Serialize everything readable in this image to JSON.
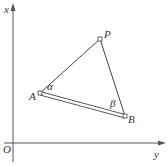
{
  "figure": {
    "type": "geometry-diagram",
    "axes": {
      "vertical_label": "x",
      "horizontal_label": "y",
      "origin_label": "O"
    },
    "points": {
      "P": {
        "label": "P"
      },
      "A": {
        "label": "A"
      },
      "B": {
        "label": "B"
      }
    },
    "angles": {
      "alpha": "α",
      "beta": "β"
    },
    "colors": {
      "stroke": "#444444",
      "text": "#333333",
      "background": "#ffffff"
    }
  }
}
